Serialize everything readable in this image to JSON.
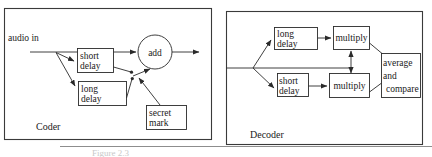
{
  "figure": {
    "caption": "Figure 2.3",
    "panels": [
      {
        "id": "coder",
        "label": "Coder",
        "input_label": "audio in",
        "nodes": [
          {
            "id": "short-delay",
            "lines": [
              "short",
              "delay"
            ]
          },
          {
            "id": "long-delay",
            "lines": [
              "long",
              "delay"
            ]
          },
          {
            "id": "add",
            "lines": [
              "add"
            ]
          },
          {
            "id": "secret-mark",
            "lines": [
              "secret",
              "mark"
            ]
          }
        ]
      },
      {
        "id": "decoder",
        "label": "Decoder",
        "input_label": "",
        "nodes": [
          {
            "id": "long-delay",
            "lines": [
              "long",
              "delay"
            ]
          },
          {
            "id": "short-delay",
            "lines": [
              "short",
              "delay"
            ]
          },
          {
            "id": "multiply-top",
            "lines": [
              "multiply"
            ]
          },
          {
            "id": "multiply-bottom",
            "lines": [
              "multiply"
            ]
          },
          {
            "id": "average-and-compare",
            "lines": [
              "average",
              "and",
              "compare"
            ]
          }
        ]
      }
    ],
    "colors": {
      "stroke": "#2a2a2a",
      "panel_stroke": "#3a3a3a",
      "background": "#ffffff",
      "caption": "#c9c9c9"
    }
  }
}
